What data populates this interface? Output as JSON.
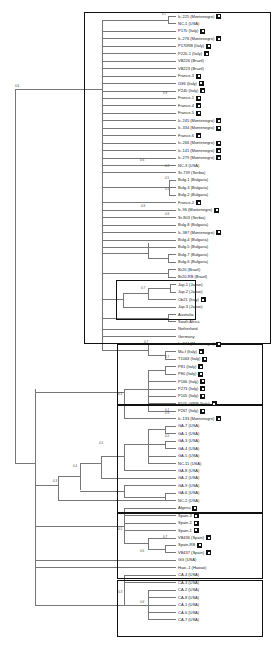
{
  "figure": {
    "type": "phylogenetic-tree",
    "leaf_start_y": 16,
    "leaf_spacing": 7.45,
    "leaf_x": 178,
    "leaves": [
      {
        "label": "Ic-225 (Montenegro)",
        "mark": true
      },
      {
        "label": "NC-1 (USA)",
        "mark": false
      },
      {
        "label": "P170 (Italy)",
        "mark": true
      },
      {
        "label": "Ic-276 (Montenegro)",
        "mark": true
      },
      {
        "label": "P170RB (Italy)",
        "mark": true
      },
      {
        "label": "P220-1 (Italy)",
        "mark": true
      },
      {
        "label": "VB226 (Brazil)",
        "mark": false
      },
      {
        "label": "VB223 (Brazil)",
        "mark": false
      },
      {
        "label": "France-3",
        "mark": true
      },
      {
        "label": "I186 (Italy)",
        "mark": true
      },
      {
        "label": "P240 (Italy)",
        "mark": true
      },
      {
        "label": "France-1",
        "mark": true
      },
      {
        "label": "France-4",
        "mark": true
      },
      {
        "label": "France-5",
        "mark": true
      },
      {
        "label": "Ic-245 (Montenegro)",
        "mark": true
      },
      {
        "label": "Ic-334 (Montenegro)",
        "mark": true
      },
      {
        "label": "France-6",
        "mark": true
      },
      {
        "label": "Ic-266 (Montenegro)",
        "mark": true
      },
      {
        "label": "Ic-141 (Montenegro)",
        "mark": true
      },
      {
        "label": "Ic-279 (Montenegro)",
        "mark": true
      },
      {
        "label": "NC-3 (USA)",
        "mark": false
      },
      {
        "label": "Sr-739 (Serbia)",
        "mark": false
      },
      {
        "label": "Bulg-1 (Bulgaria)",
        "mark": false
      },
      {
        "label": "Bulg-3 (Bulgaria)",
        "mark": false
      },
      {
        "label": "Bulg-2 (Bulgaria)",
        "mark": false
      },
      {
        "label": "France-2",
        "mark": true
      },
      {
        "label": "Ic-96 (Montenegro)",
        "mark": true
      },
      {
        "label": "Sr-803 (Serbia)",
        "mark": false
      },
      {
        "label": "Bulg-8 (Bulgaria)",
        "mark": false
      },
      {
        "label": "Ic-387 (Montenegro)",
        "mark": true
      },
      {
        "label": "Bulg-4 (Bulgaria)",
        "mark": false
      },
      {
        "label": "Bulg-5 (Bulgaria)",
        "mark": false
      },
      {
        "label": "Bulg-7 (Bulgaria)",
        "mark": false
      },
      {
        "label": "Bulg-6 (Bulgaria)",
        "mark": false
      },
      {
        "label": "Br20 (Brazil)",
        "mark": false
      },
      {
        "label": "Br20-RB (Brazil)",
        "mark": false
      },
      {
        "label": "Jap-1 (Japan)",
        "mark": false
      },
      {
        "label": "Jap-2 (Japan)",
        "mark": false
      },
      {
        "label": "Ob21 (Italy)",
        "mark": true
      },
      {
        "label": "Jap-3 (Japan)",
        "mark": false
      },
      {
        "label": "Australia",
        "mark": false
      },
      {
        "label": "South Africa",
        "mark": false
      },
      {
        "label": "Netherland",
        "mark": false
      },
      {
        "label": "Germany",
        "mark": false
      },
      {
        "label": "Ic-344 (Montenegro)",
        "mark": true
      },
      {
        "label": "Ma.f (Italy)",
        "mark": true
      },
      {
        "label": "T1063 (Italy)",
        "mark": true
      },
      {
        "label": "P81 (Italy)",
        "mark": true
      },
      {
        "label": "P80 (Italy)",
        "mark": true
      },
      {
        "label": "P166 (Italy)",
        "mark": true
      },
      {
        "label": "P273 (Italy)",
        "mark": true
      },
      {
        "label": "P105 (Italy)",
        "mark": true
      },
      {
        "label": "P105-06RB (Italy)",
        "mark": true
      },
      {
        "label": "P267 (Italy)",
        "mark": true
      },
      {
        "label": "Ic-133 (Montenegro)",
        "mark": true
      },
      {
        "label": "GA-7 (USA)",
        "mark": false
      },
      {
        "label": "GA-1 (USA)",
        "mark": false
      },
      {
        "label": "GA-3 (USA)",
        "mark": false
      },
      {
        "label": "GA-4 (USA)",
        "mark": false
      },
      {
        "label": "GA-5 (USA)",
        "mark": false
      },
      {
        "label": "NC-11 (USA)",
        "mark": false
      },
      {
        "label": "GA-8 (USA)",
        "mark": false
      },
      {
        "label": "GA-2 (USA)",
        "mark": false
      },
      {
        "label": "GA-9 (USA)",
        "mark": false
      },
      {
        "label": "GA-6 (USA)",
        "mark": false
      },
      {
        "label": "NC-2 (USA)",
        "mark": false
      },
      {
        "label": "Algeria",
        "mark": true
      },
      {
        "label": "Spain-3",
        "mark": true
      },
      {
        "label": "Spain-2",
        "mark": true
      },
      {
        "label": "Spain-1",
        "mark": true
      },
      {
        "label": "VB436 (Spain)",
        "mark": true
      },
      {
        "label": "Spain-RB",
        "mark": true
      },
      {
        "label": "VB437 (Spain)",
        "mark": true
      },
      {
        "label": "GG (USA)",
        "mark": false
      },
      {
        "label": "Haw.-1 (Hawaii)",
        "mark": false
      },
      {
        "label": "CA-4 (USA)",
        "mark": false
      },
      {
        "label": "CA-3 (USA)",
        "mark": false
      },
      {
        "label": "CA-2 (USA)",
        "mark": false
      },
      {
        "label": "CA-8 (USA)",
        "mark": false
      },
      {
        "label": "CA-1 (USA)",
        "mark": false
      },
      {
        "label": "CA-6 (USA)",
        "mark": false
      },
      {
        "label": "CA-7 (USA)",
        "mark": false
      }
    ],
    "bootstrap_labels": [
      {
        "value": "0.7",
        "x": 162,
        "y": 16
      },
      {
        "value": "0.6",
        "x": 15,
        "y": 88
      },
      {
        "value": "0.9",
        "x": 163,
        "y": 95
      },
      {
        "value": "0.6",
        "x": 140,
        "y": 162
      },
      {
        "value": "0.2",
        "x": 165,
        "y": 168
      },
      {
        "value": "0.5",
        "x": 165,
        "y": 180
      },
      {
        "value": "0.5",
        "x": 165,
        "y": 191
      },
      {
        "value": "0.9",
        "x": 141,
        "y": 208
      },
      {
        "value": "0.6",
        "x": 165,
        "y": 216
      },
      {
        "value": "0.7",
        "x": 141,
        "y": 290
      },
      {
        "value": "0.7",
        "x": 144,
        "y": 344
      },
      {
        "value": "0.7",
        "x": 165,
        "y": 359
      },
      {
        "value": "0.9",
        "x": 165,
        "y": 415
      },
      {
        "value": "0.3",
        "x": 118,
        "y": 396
      },
      {
        "value": "0.1",
        "x": 165,
        "y": 412
      },
      {
        "value": "0.5",
        "x": 165,
        "y": 438
      },
      {
        "value": "0.5",
        "x": 99,
        "y": 445
      },
      {
        "value": "0.4",
        "x": 73,
        "y": 468
      },
      {
        "value": "0.3",
        "x": 53,
        "y": 483
      },
      {
        "value": "0.7",
        "x": 163,
        "y": 539
      },
      {
        "value": "0.5",
        "x": 118,
        "y": 531
      },
      {
        "value": "0.6",
        "x": 140,
        "y": 553
      },
      {
        "value": "0.3",
        "x": 118,
        "y": 594
      },
      {
        "value": "0.6",
        "x": 140,
        "y": 604
      }
    ],
    "boxes": [
      {
        "name": "box-clade-europe-main",
        "x": 84,
        "y": 12,
        "w": 187,
        "h": 332
      },
      {
        "name": "box-clade-japan",
        "x": 116,
        "y": 280,
        "w": 80,
        "h": 40
      },
      {
        "name": "box-clade-italy",
        "x": 117,
        "y": 344,
        "w": 146,
        "h": 61
      },
      {
        "name": "box-clade-usa-ga",
        "x": 117,
        "y": 405,
        "w": 146,
        "h": 108
      },
      {
        "name": "box-clade-spain",
        "x": 117,
        "y": 513,
        "w": 146,
        "h": 66
      },
      {
        "name": "box-clade-usa-ca",
        "x": 117,
        "y": 580,
        "w": 146,
        "h": 57
      }
    ]
  }
}
